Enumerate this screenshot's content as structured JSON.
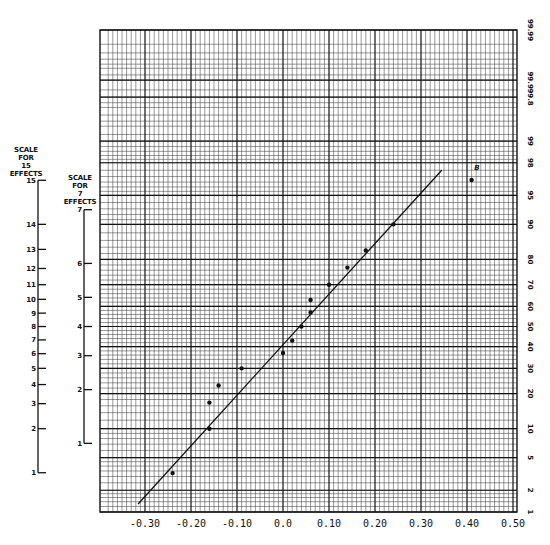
{
  "chart_data": {
    "type": "scatter",
    "xlabel": "",
    "ylabel": "Cumulative probability (%)",
    "xlim": [
      -0.375,
      0.5
    ],
    "x_ticks": [
      -0.3,
      -0.2,
      -0.1,
      0.0,
      0.1,
      0.2,
      0.3,
      0.4,
      0.5
    ],
    "x_tick_labels": [
      "-0.30",
      "-0.20",
      "-0.10",
      "0.0",
      "0.10",
      "0.20",
      "0.30",
      "0.40",
      "0.50"
    ],
    "probability_ticks": [
      1,
      2,
      5,
      10,
      20,
      30,
      40,
      50,
      60,
      70,
      80,
      90,
      95,
      98,
      99,
      99.8,
      99.9,
      99.99
    ],
    "probability_tick_labels": [
      "1",
      "2",
      "5",
      "10",
      "20",
      "30",
      "40",
      "50",
      "60",
      "70",
      "80",
      "90",
      "95",
      "98",
      "99",
      "99.8",
      "99.9",
      "99.99"
    ],
    "grid": true,
    "series": [
      {
        "name": "effects",
        "points": [
          {
            "x": -0.24,
            "p": 3.3
          },
          {
            "x": -0.16,
            "p": 10
          },
          {
            "x": -0.16,
            "p": 17
          },
          {
            "x": -0.14,
            "p": 23
          },
          {
            "x": -0.09,
            "p": 30
          },
          {
            "x": 0.0,
            "p": 37
          },
          {
            "x": 0.02,
            "p": 43
          },
          {
            "x": 0.04,
            "p": 50
          },
          {
            "x": 0.06,
            "p": 57
          },
          {
            "x": 0.06,
            "p": 63
          },
          {
            "x": 0.1,
            "p": 70
          },
          {
            "x": 0.14,
            "p": 77
          },
          {
            "x": 0.18,
            "p": 83
          },
          {
            "x": 0.24,
            "p": 90
          },
          {
            "x": 0.41,
            "p": 96.7,
            "label": "B"
          }
        ]
      }
    ],
    "fit_line": {
      "from": {
        "x": -0.315,
        "p": 1.3
      },
      "to": {
        "x": 0.345,
        "p": 97.5
      }
    },
    "annotations": [
      {
        "text": "B",
        "x": 0.42,
        "p": 97.8
      }
    ],
    "side_scales": [
      {
        "title": "SCALE FOR 15 EFFECTS",
        "ticks": [
          1,
          2,
          3,
          4,
          5,
          6,
          7,
          8,
          9,
          10,
          11,
          12,
          13,
          14,
          15
        ]
      },
      {
        "title": "SCALE FOR 7 EFFECTS",
        "ticks": [
          1,
          2,
          3,
          4,
          5,
          6,
          7
        ]
      }
    ]
  },
  "labels": {
    "scale15_title": [
      "SCALE",
      "FOR",
      "15",
      "EFFECTS"
    ],
    "scale7_title": [
      "SCALE",
      "FOR",
      "7",
      "EFFECTS"
    ],
    "point_annotation": "B"
  }
}
